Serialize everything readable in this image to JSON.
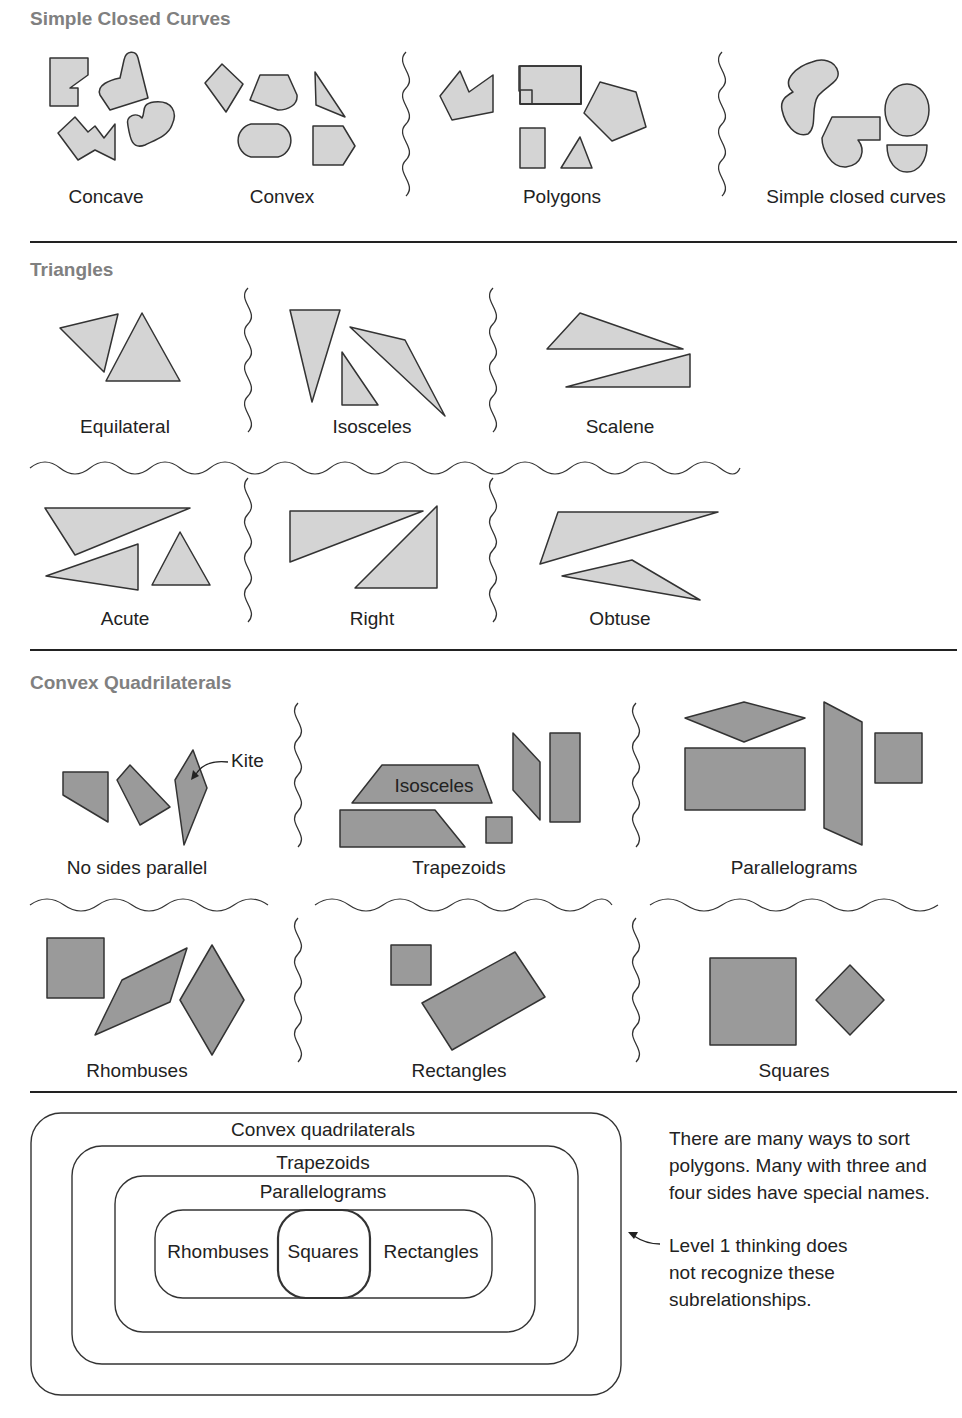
{
  "sections": {
    "simple_closed_curves": {
      "title": "Simple Closed Curves",
      "groups": [
        "Concave",
        "Convex",
        "Polygons",
        "Simple closed curves"
      ]
    },
    "triangles": {
      "title": "Triangles",
      "row1": [
        "Equilateral",
        "Isosceles",
        "Scalene"
      ],
      "row2": [
        "Acute",
        "Right",
        "Obtuse"
      ]
    },
    "convex_quadrilaterals": {
      "title": "Convex Quadrilaterals",
      "row1": [
        "No sides parallel",
        "Trapezoids",
        "Parallelograms"
      ],
      "row2": [
        "Rhombuses",
        "Rectangles",
        "Squares"
      ],
      "kite_label": "Kite",
      "isosceles_label": "Isosceles"
    }
  },
  "hierarchy": {
    "outer": "Convex quadrilaterals",
    "level2": "Trapezoids",
    "level3": "Parallelograms",
    "left": "Rhombuses",
    "center": "Squares",
    "right": "Rectangles"
  },
  "notes": {
    "note1_line1": "There are many ways to sort",
    "note1_line2": "polygons. Many with three and",
    "note1_line3": "four sides have special names.",
    "note2_line1": "Level 1 thinking does",
    "note2_line2": "not recognize these",
    "note2_line3": "subrelationships."
  },
  "colors": {
    "light_fill": "#d4d4d4",
    "dark_fill": "#9a9a9a",
    "stroke": "#333333",
    "section_title": "#808080"
  }
}
